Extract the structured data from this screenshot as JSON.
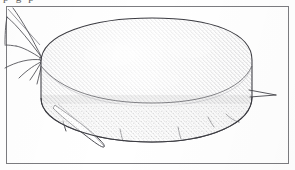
{
  "page": {
    "kind": "scanned-figure-plate",
    "background_color": "#ffffff",
    "width": 295,
    "height": 170
  },
  "clipped_caption": {
    "text": "p g p",
    "note": "partially cropped line of text at the very top edge; only descenders visible"
  },
  "figure": {
    "title": "",
    "frame": {
      "stroke_color": "#7c7c80",
      "stroke_width": 1,
      "x": 6,
      "y": 6,
      "width": 283,
      "height": 158
    },
    "subject": {
      "name": "disc-shaped-mite-dorsolateral-view",
      "description": "Stippled ink drawing of a broad, flattened disc-shaped arthropod body (idiosoma) in oblique dorsolateral view, with a marginal rim line, fine setae along the ventral margin, a lateral spine at the right, a flap-like appendage at the lower left, and slender legs/antenna-like appendages projecting from the upper left.",
      "ink_color": "#3c3c40",
      "stipple_color": "#6a6a70"
    },
    "parts": [
      {
        "label": "dorsal-disc",
        "kind": "stippled-ellipse"
      },
      {
        "label": "marginal-rim-line",
        "kind": "curve"
      },
      {
        "label": "lateral-spine-right",
        "kind": "spine"
      },
      {
        "label": "ventral-setae",
        "kind": "bristles",
        "count": 4
      },
      {
        "label": "flap-appendage-lower-left",
        "kind": "lobe"
      },
      {
        "label": "anterior-legs-upper-left",
        "kind": "slender-limbs",
        "count": 5
      },
      {
        "label": "attachment-node",
        "kind": "small-circle"
      },
      {
        "label": "corner-diagonal-line",
        "kind": "stray-scan-line"
      }
    ]
  }
}
